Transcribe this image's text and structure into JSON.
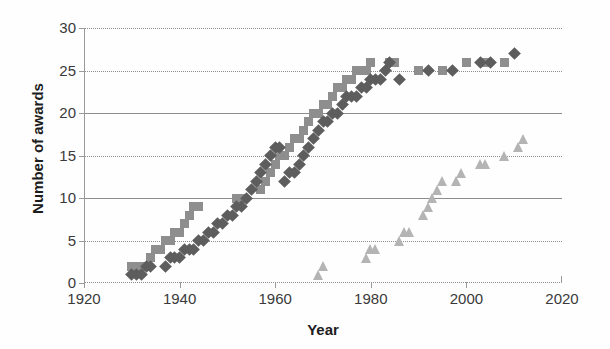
{
  "chart_data": {
    "type": "scatter",
    "title": "",
    "xlabel": "Year",
    "ylabel": "Number of awards",
    "xlim": [
      1920,
      2020
    ],
    "ylim": [
      0,
      30
    ],
    "xticks": [
      1920,
      1940,
      1960,
      1980,
      2000,
      2020
    ],
    "yticks": [
      0,
      5,
      10,
      15,
      20,
      25,
      30
    ],
    "grid": true,
    "legend": "none",
    "series": [
      {
        "name": "squares",
        "marker": "square",
        "color": "#8e8e8e",
        "points": [
          [
            1930,
            2
          ],
          [
            1931,
            2
          ],
          [
            1932,
            2
          ],
          [
            1933,
            2
          ],
          [
            1934,
            3
          ],
          [
            1935,
            4
          ],
          [
            1936,
            4
          ],
          [
            1937,
            5
          ],
          [
            1938,
            5
          ],
          [
            1939,
            6
          ],
          [
            1940,
            6
          ],
          [
            1941,
            7
          ],
          [
            1942,
            8
          ],
          [
            1943,
            9
          ],
          [
            1944,
            9
          ],
          [
            1952,
            10
          ],
          [
            1953,
            10
          ],
          [
            1957,
            11
          ],
          [
            1958,
            12
          ],
          [
            1959,
            13
          ],
          [
            1960,
            14
          ],
          [
            1961,
            15
          ],
          [
            1962,
            15
          ],
          [
            1963,
            16
          ],
          [
            1964,
            17
          ],
          [
            1965,
            17
          ],
          [
            1966,
            18
          ],
          [
            1967,
            19
          ],
          [
            1968,
            20
          ],
          [
            1969,
            20
          ],
          [
            1970,
            21
          ],
          [
            1971,
            21
          ],
          [
            1972,
            22
          ],
          [
            1973,
            23
          ],
          [
            1974,
            23
          ],
          [
            1975,
            24
          ],
          [
            1976,
            24
          ],
          [
            1977,
            25
          ],
          [
            1978,
            25
          ],
          [
            1979,
            25
          ],
          [
            1980,
            26
          ],
          [
            1984,
            26
          ],
          [
            1985,
            26
          ],
          [
            1990,
            25
          ],
          [
            1995,
            25
          ],
          [
            2000,
            26
          ],
          [
            2004,
            26
          ],
          [
            2008,
            26
          ]
        ]
      },
      {
        "name": "diamonds",
        "marker": "diamond",
        "color": "#5d5d5d",
        "points": [
          [
            1930,
            1
          ],
          [
            1931,
            1
          ],
          [
            1932,
            1
          ],
          [
            1933,
            2
          ],
          [
            1934,
            2
          ],
          [
            1937,
            2
          ],
          [
            1938,
            3
          ],
          [
            1939,
            3
          ],
          [
            1940,
            3
          ],
          [
            1941,
            4
          ],
          [
            1942,
            4
          ],
          [
            1943,
            4
          ],
          [
            1944,
            5
          ],
          [
            1945,
            5
          ],
          [
            1946,
            6
          ],
          [
            1947,
            6
          ],
          [
            1948,
            7
          ],
          [
            1949,
            7
          ],
          [
            1950,
            8
          ],
          [
            1951,
            8
          ],
          [
            1952,
            9
          ],
          [
            1953,
            9
          ],
          [
            1954,
            10
          ],
          [
            1955,
            11
          ],
          [
            1956,
            12
          ],
          [
            1957,
            13
          ],
          [
            1958,
            14
          ],
          [
            1959,
            15
          ],
          [
            1960,
            16
          ],
          [
            1961,
            16
          ],
          [
            1962,
            12
          ],
          [
            1963,
            13
          ],
          [
            1964,
            13
          ],
          [
            1965,
            14
          ],
          [
            1966,
            15
          ],
          [
            1967,
            16
          ],
          [
            1968,
            17
          ],
          [
            1969,
            18
          ],
          [
            1970,
            19
          ],
          [
            1971,
            19
          ],
          [
            1972,
            20
          ],
          [
            1973,
            20
          ],
          [
            1974,
            21
          ],
          [
            1975,
            22
          ],
          [
            1976,
            22
          ],
          [
            1977,
            22
          ],
          [
            1978,
            23
          ],
          [
            1979,
            23
          ],
          [
            1980,
            24
          ],
          [
            1981,
            24
          ],
          [
            1982,
            24
          ],
          [
            1983,
            25
          ],
          [
            1984,
            26
          ],
          [
            1986,
            24
          ],
          [
            1992,
            25
          ],
          [
            1997,
            25
          ],
          [
            2003,
            26
          ],
          [
            2005,
            26
          ],
          [
            2010,
            27
          ]
        ]
      },
      {
        "name": "triangles",
        "marker": "triangle",
        "color": "#b4b4b4",
        "points": [
          [
            1969,
            1
          ],
          [
            1970,
            2
          ],
          [
            1979,
            3
          ],
          [
            1980,
            4
          ],
          [
            1981,
            4
          ],
          [
            1986,
            5
          ],
          [
            1987,
            6
          ],
          [
            1988,
            6
          ],
          [
            1991,
            8
          ],
          [
            1992,
            9
          ],
          [
            1993,
            10
          ],
          [
            1994,
            11
          ],
          [
            1995,
            12
          ],
          [
            1998,
            12
          ],
          [
            1999,
            13
          ],
          [
            2003,
            14
          ],
          [
            2004,
            14
          ],
          [
            2008,
            15
          ],
          [
            2011,
            16
          ],
          [
            2012,
            17
          ]
        ]
      }
    ]
  }
}
